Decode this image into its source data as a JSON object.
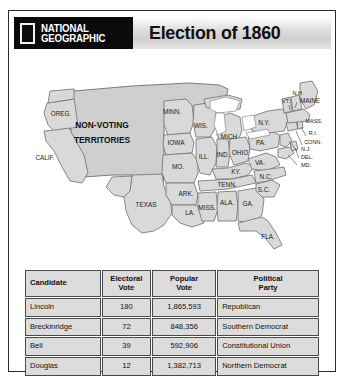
{
  "header": {
    "logo_rect": "ng-yellow-rectangle-icon",
    "brand_line1": "NATIONAL",
    "brand_line2": "GEOGRAPHIC",
    "title": "Election of 1860"
  },
  "map": {
    "territory_label_line1": "NON-VOTING",
    "territory_label_line2": "TERRITORIES",
    "states": [
      {
        "id": "oregon",
        "label": "OREG.",
        "x": 47,
        "y": 61
      },
      {
        "id": "california",
        "label": "CALIF.",
        "x": 31,
        "y": 105
      },
      {
        "id": "minnesota",
        "label": "MINN.",
        "x": 158,
        "y": 59
      },
      {
        "id": "wisconsin",
        "label": "WIS.",
        "x": 187,
        "y": 73
      },
      {
        "id": "michigan",
        "label": "MICH",
        "x": 215,
        "y": 84
      },
      {
        "id": "iowa",
        "label": "IOWA",
        "x": 160,
        "y": 88
      },
      {
        "id": "illinois",
        "label": "ILL.",
        "x": 190,
        "y": 104
      },
      {
        "id": "indiana",
        "label": "IND.",
        "x": 209,
        "y": 102
      },
      {
        "id": "ohio",
        "label": "OHIO",
        "x": 225,
        "y": 100
      },
      {
        "id": "missouri",
        "label": "MO.",
        "x": 163,
        "y": 112
      },
      {
        "id": "kentucky",
        "label": "KY.",
        "x": 222,
        "y": 117
      },
      {
        "id": "tennessee",
        "label": "TENN.",
        "x": 213,
        "y": 131
      },
      {
        "id": "arkansas",
        "label": "ARK.",
        "x": 174,
        "y": 140
      },
      {
        "id": "mississippi",
        "label": "MISS.",
        "x": 195,
        "y": 155
      },
      {
        "id": "alabama",
        "label": "ALA.",
        "x": 214,
        "y": 150
      },
      {
        "id": "georgia",
        "label": "GA.",
        "x": 234,
        "y": 151
      },
      {
        "id": "louisiana",
        "label": "LA.",
        "x": 178,
        "y": 158
      },
      {
        "id": "texas",
        "label": "TEXAS",
        "x": 128,
        "y": 155
      },
      {
        "id": "florida",
        "label": "FLA.",
        "x": 255,
        "y": 182
      },
      {
        "id": "north-carolina",
        "label": "N.C.",
        "x": 248,
        "y": 125
      },
      {
        "id": "south-carolina",
        "label": "S.C.",
        "x": 245,
        "y": 139
      },
      {
        "id": "virginia",
        "label": "VA.",
        "x": 243,
        "y": 107
      },
      {
        "id": "pennsylvania",
        "label": "PA.",
        "x": 245,
        "y": 88
      },
      {
        "id": "new-york",
        "label": "N.Y.",
        "x": 250,
        "y": 72
      },
      {
        "id": "vermont",
        "label": "VT.",
        "x": 273,
        "y": 51
      },
      {
        "id": "new-hampshire",
        "label": "N.H.",
        "x": 283,
        "y": 43
      },
      {
        "id": "maine",
        "label": "MAINE",
        "x": 293,
        "y": 52
      },
      {
        "id": "massachusetts",
        "label": "MASS.",
        "x": 296,
        "y": 68
      },
      {
        "id": "rhode-island",
        "label": "R.I.",
        "x": 295,
        "y": 81
      },
      {
        "id": "connecticut",
        "label": "CONN.",
        "x": 290,
        "y": 89
      },
      {
        "id": "new-jersey",
        "label": "N.J.",
        "x": 285,
        "y": 96
      },
      {
        "id": "delaware",
        "label": "DEL.",
        "x": 287,
        "y": 103
      },
      {
        "id": "maryland",
        "label": "MD.",
        "x": 285,
        "y": 110
      }
    ]
  },
  "table": {
    "columns": [
      "Candidate",
      "Electoral\nVote",
      "Popular\nVote",
      "Political\nParty"
    ],
    "col_candidate": "Candidate",
    "col_electoral_l1": "Electoral",
    "col_electoral_l2": "Vote",
    "col_popular_l1": "Popular",
    "col_popular_l2": "Vote",
    "col_party_l1": "Political",
    "col_party_l2": "Party",
    "rows": [
      {
        "candidate": "Lincoln",
        "electoral": "180",
        "popular": "1,865,593",
        "party": "Republican"
      },
      {
        "candidate": "Breckinridge",
        "electoral": "72",
        "popular": "848,356",
        "party": "Southern Democrat"
      },
      {
        "candidate": "Bell",
        "electoral": "39",
        "popular": "592,906",
        "party": "Constitutional Union"
      },
      {
        "candidate": "Douglas",
        "electoral": "12",
        "popular": "1,382,713",
        "party": "Northern Democrat"
      }
    ]
  },
  "colors": {
    "logo_black": "#0b0b0b",
    "state_fill": "#d9d9d9",
    "territory_fill": "#cfcfcf",
    "table_cell": "#dcdcdc",
    "border": "#2a2a2a"
  }
}
